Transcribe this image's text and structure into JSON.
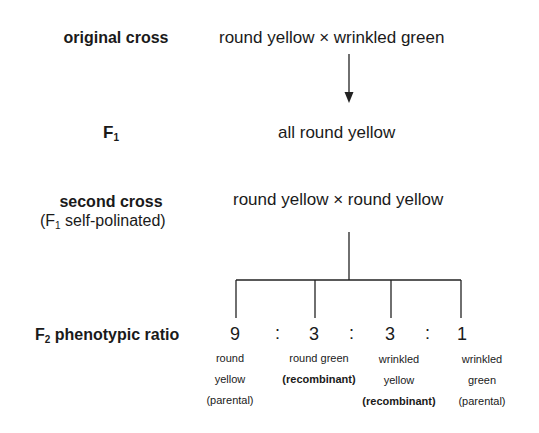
{
  "rows": {
    "original_cross": {
      "label": "original cross",
      "content": "round yellow × wrinkled green"
    },
    "f1": {
      "label_main": "F",
      "label_sub": "1",
      "content": "all round yellow"
    },
    "second_cross": {
      "label": "second cross",
      "label_note_prefix": "(F",
      "label_note_sub": "1",
      "label_note_suffix": " self-polinated)",
      "content": "round yellow × round yellow"
    },
    "f2": {
      "label_main": "F",
      "label_sub": "2",
      "label_suffix": " phenotypic ratio",
      "separator": ":",
      "outcomes": [
        {
          "ratio": "9",
          "line1": "round",
          "line2": "yellow",
          "line3": "(parental)"
        },
        {
          "ratio": "3",
          "line1": "round green",
          "line2": "(recombinant)",
          "line3": ""
        },
        {
          "ratio": "3",
          "line1": "wrinkled",
          "line2": "yellow",
          "line3": "(recombinant)"
        },
        {
          "ratio": "1",
          "line1": "wrinkled",
          "line2": "green",
          "line3": "(parental)"
        }
      ]
    }
  },
  "colors": {
    "text": "#1a1a1a",
    "lines": "#222222",
    "background": "#ffffff"
  }
}
